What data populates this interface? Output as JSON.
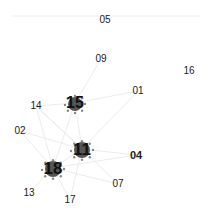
{
  "diagram": {
    "type": "network-graph",
    "top_rule": {
      "x1": 12,
      "x2": 200,
      "y": 16,
      "color": "#eeeeee"
    },
    "edge_color": "#e6e6e6",
    "hub_color": "#555555",
    "satellite_color": "#888888",
    "nodes": [
      {
        "id": "05",
        "label": "05",
        "x": 105,
        "y": 20,
        "size": "small"
      },
      {
        "id": "09",
        "label": "09",
        "x": 101,
        "y": 59,
        "size": "small"
      },
      {
        "id": "16",
        "label": "16",
        "x": 189,
        "y": 71,
        "size": "small"
      },
      {
        "id": "01",
        "label": "01",
        "x": 138,
        "y": 91,
        "size": "small"
      },
      {
        "id": "14",
        "label": "14",
        "x": 36,
        "y": 106,
        "size": "small"
      },
      {
        "id": "15",
        "label": "15",
        "x": 75,
        "y": 103,
        "size": "hub",
        "font": 16,
        "r": 7
      },
      {
        "id": "02",
        "label": "02",
        "x": 20,
        "y": 131,
        "size": "small"
      },
      {
        "id": "11",
        "label": "11",
        "x": 82,
        "y": 149,
        "size": "hub",
        "font": 17,
        "r": 8
      },
      {
        "id": "04",
        "label": "04",
        "x": 136,
        "y": 155,
        "size": "small",
        "bold": true
      },
      {
        "id": "18",
        "label": "18",
        "x": 53,
        "y": 168,
        "size": "hub",
        "font": 17,
        "r": 8
      },
      {
        "id": "07",
        "label": "07",
        "x": 118,
        "y": 184,
        "size": "small"
      },
      {
        "id": "13",
        "label": "13",
        "x": 29,
        "y": 193,
        "size": "small"
      },
      {
        "id": "17",
        "label": "17",
        "x": 70,
        "y": 200,
        "size": "small"
      }
    ],
    "edges": [
      [
        "15",
        "11"
      ],
      [
        "15",
        "18"
      ],
      [
        "15",
        "14"
      ],
      [
        "15",
        "01"
      ],
      [
        "15",
        "09"
      ],
      [
        "11",
        "18"
      ],
      [
        "11",
        "04"
      ],
      [
        "11",
        "01"
      ],
      [
        "11",
        "07"
      ],
      [
        "11",
        "17"
      ],
      [
        "11",
        "14"
      ],
      [
        "18",
        "02"
      ],
      [
        "18",
        "14"
      ],
      [
        "18",
        "13"
      ],
      [
        "18",
        "17"
      ],
      [
        "18",
        "04"
      ],
      [
        "18",
        "07"
      ],
      [
        "02",
        "11"
      ],
      [
        "14",
        "11"
      ]
    ]
  }
}
